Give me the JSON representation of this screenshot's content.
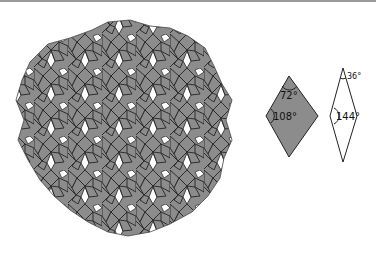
{
  "figure": {
    "colors": {
      "thick_fill": "#8c8c8c",
      "thin_fill": "#ffffff",
      "stroke": "#222222",
      "background": "#ffffff"
    }
  },
  "legend": {
    "thick_rhombus": {
      "acute_angle": "72°",
      "obtuse_angle": "108°"
    },
    "thin_rhombus": {
      "acute_angle": "36°",
      "obtuse_angle": "144°"
    }
  }
}
